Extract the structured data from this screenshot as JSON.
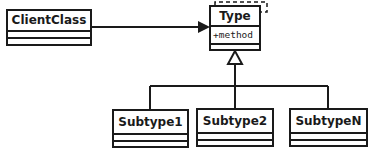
{
  "diagram": {
    "type": "UML class diagram",
    "classes": {
      "client": {
        "name": "ClientClass"
      },
      "type": {
        "name": "Type",
        "operations": [
          "+method"
        ],
        "template_marker": "dashed"
      },
      "subtypes": [
        {
          "name": "Subtype1"
        },
        {
          "name": "Subtype2"
        },
        {
          "name": "SubtypeN"
        }
      ]
    },
    "relations": [
      {
        "from": "ClientClass",
        "to": "Type",
        "kind": "association"
      },
      {
        "from": "Subtype1",
        "to": "Type",
        "kind": "generalization"
      },
      {
        "from": "Subtype2",
        "to": "Type",
        "kind": "generalization"
      },
      {
        "from": "SubtypeN",
        "to": "Type",
        "kind": "generalization"
      }
    ],
    "colors": {
      "stroke": "#1a1a1a",
      "background": "#ffffff"
    }
  }
}
